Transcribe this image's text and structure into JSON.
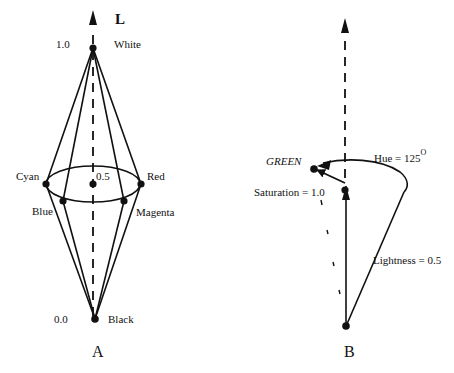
{
  "panelA": {
    "caption": "A",
    "axis_label": "L",
    "top_value": "1.0",
    "top_label": "White",
    "mid_value": "0.5",
    "bottom_value": "0.0",
    "bottom_label": "Black",
    "hues": [
      {
        "label": "Cyan"
      },
      {
        "label": "Red"
      },
      {
        "label": "Blue"
      },
      {
        "label": "Magenta"
      }
    ]
  },
  "panelB": {
    "caption": "B",
    "point_label": "GREEN",
    "hue_label": "Hue = 125",
    "hue_superscript": "O",
    "saturation_label": "Saturation = 1.0",
    "lightness_label": "Lightness = 0.5"
  },
  "colors": {
    "ink": "#111111",
    "background": "#ffffff"
  }
}
